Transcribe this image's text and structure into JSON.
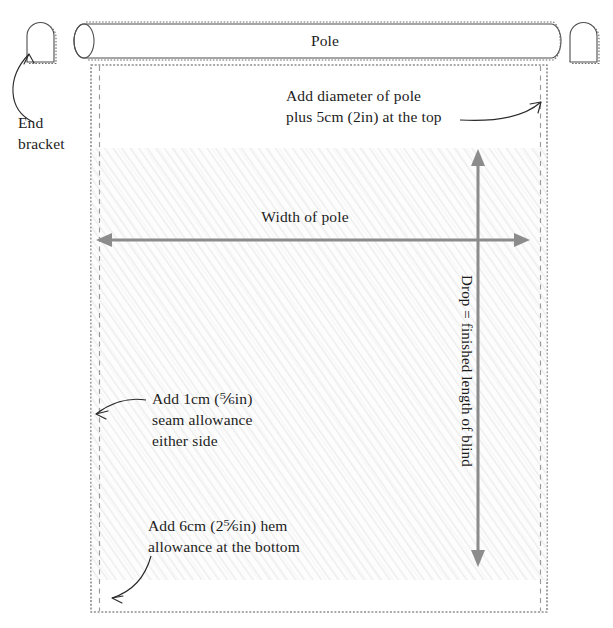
{
  "diagram": {
    "colors": {
      "fabric_fill": "#fcfcfc",
      "hatch_line": "#ececec",
      "outline": "#4d4d4d",
      "dimension_arrow": "#8c8c8c",
      "seam_dash": "#9a9a9a",
      "text": "#1c1c1c",
      "background": "#ffffff"
    },
    "labels": {
      "pole": "Pole",
      "end_bracket_line1": "End",
      "end_bracket_line2": "bracket",
      "top_allowance_line1": "Add diameter of pole",
      "top_allowance_line2": "plus 5cm (2in) at the top",
      "width_of_pole": "Width of pole",
      "drop": "Drop = finished length of blind",
      "seam_line1": "Add 1cm (⅚in)",
      "seam_line2": "seam allowance",
      "seam_line3": "either side",
      "hem_line1": "Add 6cm (2⅚in) hem",
      "hem_line2": "allowance at the bottom"
    },
    "measurements": {
      "top_allowance_metric": "5cm",
      "top_allowance_imperial": "2in",
      "seam_allowance_metric": "1cm",
      "seam_allowance_imperial": "⅚in",
      "hem_allowance_metric": "6cm",
      "hem_allowance_imperial": "2⅚in"
    },
    "parts": {
      "pole_name": "curtain pole",
      "bracket_left_name": "left end bracket",
      "bracket_right_name": "right end bracket",
      "fabric_name": "blind fabric panel"
    }
  }
}
